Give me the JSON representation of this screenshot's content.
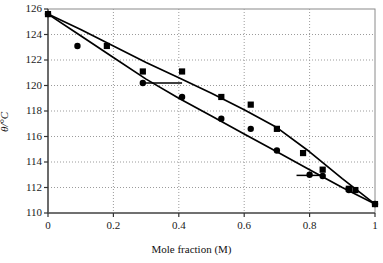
{
  "chart_data": {
    "type": "scatter",
    "title": "",
    "xlabel": "Mole fraction (M)",
    "ylabel": "θ/°C",
    "xlim": [
      0,
      1
    ],
    "ylim": [
      110,
      126
    ],
    "xticks": [
      "0",
      "0.2",
      "0.4",
      "0.6",
      "0.8",
      "1"
    ],
    "xtick_values": [
      0,
      0.2,
      0.4,
      0.6,
      0.8,
      1
    ],
    "yticks": [
      "110",
      "112",
      "114",
      "116",
      "118",
      "120",
      "122",
      "124",
      "126"
    ],
    "ytick_values": [
      110,
      112,
      114,
      116,
      118,
      120,
      122,
      124,
      126
    ],
    "grid": "dotted",
    "legend": "none",
    "series": [
      {
        "name": "Upper curve (dew / vapour line)",
        "marker": "square",
        "color": "#000000",
        "points": [
          {
            "x": 0.0,
            "y": 125.6
          },
          {
            "x": 0.18,
            "y": 123.1
          },
          {
            "x": 0.29,
            "y": 121.1
          },
          {
            "x": 0.41,
            "y": 121.1
          },
          {
            "x": 0.53,
            "y": 119.1
          },
          {
            "x": 0.62,
            "y": 118.5
          },
          {
            "x": 0.7,
            "y": 116.6
          },
          {
            "x": 0.78,
            "y": 114.7
          },
          {
            "x": 0.84,
            "y": 113.4
          },
          {
            "x": 0.92,
            "y": 111.9
          },
          {
            "x": 0.94,
            "y": 111.8
          },
          {
            "x": 1.0,
            "y": 110.7
          }
        ]
      },
      {
        "name": "Lower curve (bubble / liquid line)",
        "marker": "circle",
        "color": "#000000",
        "points": [
          {
            "x": 0.0,
            "y": 125.6
          },
          {
            "x": 0.09,
            "y": 123.1
          },
          {
            "x": 0.29,
            "y": 120.2
          },
          {
            "x": 0.41,
            "y": 119.1
          },
          {
            "x": 0.53,
            "y": 117.4
          },
          {
            "x": 0.62,
            "y": 116.6
          },
          {
            "x": 0.7,
            "y": 114.9
          },
          {
            "x": 0.8,
            "y": 113.0
          },
          {
            "x": 0.84,
            "y": 112.9
          },
          {
            "x": 0.92,
            "y": 111.8
          },
          {
            "x": 1.0,
            "y": 110.7
          }
        ]
      }
    ],
    "fit_curves": [
      {
        "name": "upper-fit",
        "points": [
          {
            "x": 0.0,
            "y": 125.6
          },
          {
            "x": 0.1,
            "y": 124.4
          },
          {
            "x": 0.2,
            "y": 123.1
          },
          {
            "x": 0.3,
            "y": 121.8
          },
          {
            "x": 0.4,
            "y": 120.6
          },
          {
            "x": 0.5,
            "y": 119.4
          },
          {
            "x": 0.6,
            "y": 118.1
          },
          {
            "x": 0.7,
            "y": 116.7
          },
          {
            "x": 0.8,
            "y": 114.8
          },
          {
            "x": 0.9,
            "y": 112.7
          },
          {
            "x": 1.0,
            "y": 110.7
          }
        ]
      },
      {
        "name": "lower-fit",
        "points": [
          {
            "x": 0.0,
            "y": 125.6
          },
          {
            "x": 0.1,
            "y": 123.9
          },
          {
            "x": 0.2,
            "y": 122.2
          },
          {
            "x": 0.3,
            "y": 120.5
          },
          {
            "x": 0.4,
            "y": 119.0
          },
          {
            "x": 0.5,
            "y": 117.6
          },
          {
            "x": 0.6,
            "y": 116.2
          },
          {
            "x": 0.7,
            "y": 114.8
          },
          {
            "x": 0.8,
            "y": 113.4
          },
          {
            "x": 0.9,
            "y": 112.0
          },
          {
            "x": 1.0,
            "y": 110.7
          }
        ]
      }
    ],
    "tie_lines": [
      {
        "name": "tie-line-1",
        "y": 120.2,
        "x_start": 0.29,
        "x_end": 0.41
      },
      {
        "name": "tie-line-2",
        "y": 112.95,
        "x_start": 0.76,
        "x_end": 0.84
      }
    ]
  }
}
